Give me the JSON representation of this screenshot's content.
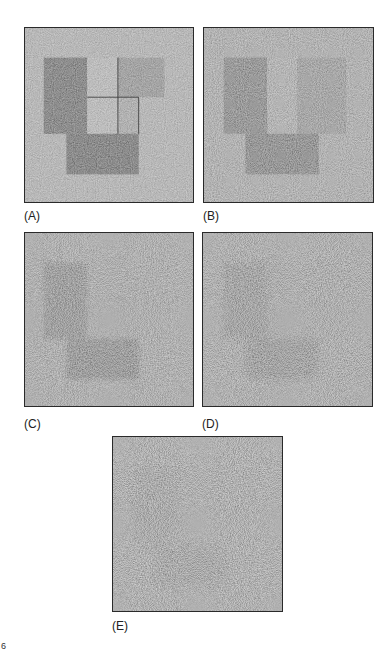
{
  "figure": {
    "panels": [
      {
        "id": "A",
        "label": "(A)",
        "noise_level": "low",
        "background": "#b4b4b4",
        "shape_contrast": "high"
      },
      {
        "id": "B",
        "label": "(B)",
        "noise_level": "moderate",
        "background": "#a6a6a6",
        "shape_contrast": "medium-high"
      },
      {
        "id": "C",
        "label": "(C)",
        "noise_level": "high",
        "background": "#9c9c9c",
        "shape_contrast": "medium"
      },
      {
        "id": "D",
        "label": "(D)",
        "noise_level": "higher",
        "background": "#979797",
        "shape_contrast": "low"
      },
      {
        "id": "E",
        "label": "(E)",
        "noise_level": "highest",
        "background": "#939393",
        "shape_contrast": "very-low"
      }
    ],
    "shapes": {
      "dark_left_rect": "#525252",
      "light_middle_rect": "#bdbdbd",
      "medium_right_rect": "#8e8e8e",
      "dark_bottom_rect": "#4a4a4a"
    },
    "corner_mark": "6"
  }
}
